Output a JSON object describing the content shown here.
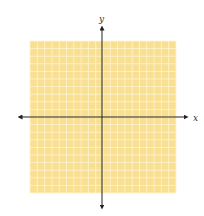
{
  "diagram": {
    "type": "coordinate-plane",
    "grid": {
      "cells_x": 20,
      "cells_y": 20,
      "background": "#f8df92",
      "line_color": "#fff4d0"
    },
    "axes": {
      "x_label": "x",
      "y_label": "y",
      "color": "#222222"
    }
  }
}
